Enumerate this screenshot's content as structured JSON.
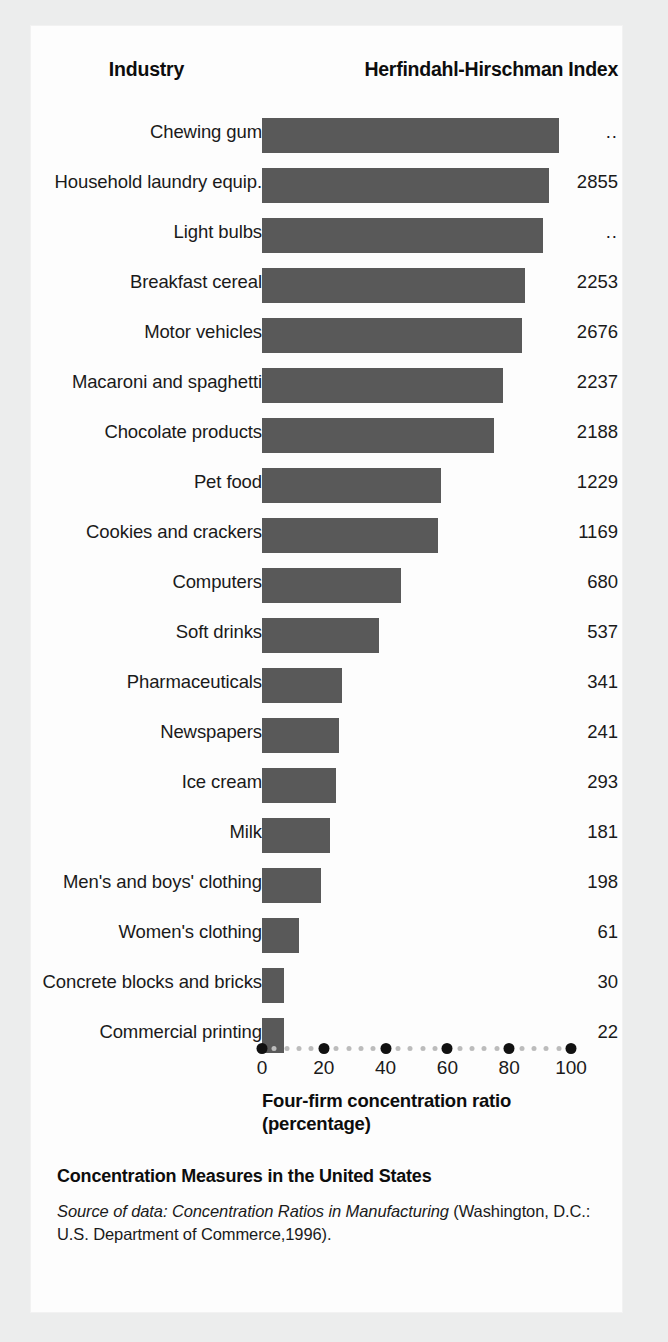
{
  "header": {
    "industry_label": "Industry",
    "hhi_label": "Herfindahl-Hirschman Index"
  },
  "axis": {
    "title_line1": "Four-firm concentration ratio",
    "title_line2": "(percentage)",
    "ticks": [
      "0",
      "20",
      "40",
      "60",
      "80",
      "100"
    ]
  },
  "footer": {
    "caption_title": "Concentration Measures in the United States",
    "source_prefix": "Source of data:",
    "source_italic_title": " Concentration Ratios in Manufacturing",
    "source_rest": " (Washington, D.C.: U.S. Department of Commerce,1996)."
  },
  "colors": {
    "bar": "#595959",
    "axis_major_dot": "#111111",
    "axis_minor_dot": "#bcbcbc",
    "card_background": "#fdfdfd",
    "page_background": "#eceded",
    "text": "#1a1a1a"
  },
  "chart_data": {
    "type": "bar",
    "orientation": "horizontal",
    "title": "Concentration Measures in the United States",
    "xlabel": "Four-firm concentration ratio (percentage)",
    "ylabel": "Industry",
    "xlim": [
      0,
      100
    ],
    "grid": false,
    "legend": "none",
    "categories": [
      "Chewing gum",
      "Household laundry equip.",
      "Light bulbs",
      "Breakfast cereal",
      "Motor vehicles",
      "Macaroni and spaghetti",
      "Chocolate products",
      "Pet food",
      "Cookies and crackers",
      "Computers",
      "Soft drinks",
      "Pharmaceuticals",
      "Newspapers",
      "Ice cream",
      "Milk",
      "Men's and boys' clothing",
      "Women's clothing",
      "Concrete blocks and bricks",
      "Commercial printing"
    ],
    "values": [
      96,
      93,
      91,
      85,
      84,
      78,
      75,
      58,
      57,
      45,
      38,
      26,
      25,
      24,
      22,
      19,
      12,
      7,
      7
    ],
    "hhi": [
      "..",
      "2855",
      "..",
      "2253",
      "2676",
      "2237",
      "2188",
      "1229",
      "1169",
      "680",
      "537",
      "341",
      "241",
      "293",
      "181",
      "198",
      "61",
      "30",
      "22"
    ],
    "series": [
      {
        "name": "Four-firm concentration ratio",
        "values": [
          96,
          93,
          91,
          85,
          84,
          78,
          75,
          58,
          57,
          45,
          38,
          26,
          25,
          24,
          22,
          19,
          12,
          7,
          7
        ]
      }
    ],
    "rows": [
      {
        "industry": "Chewing gum",
        "ratio": 96,
        "hhi": ".."
      },
      {
        "industry": "Household laundry equip.",
        "ratio": 93,
        "hhi": "2855"
      },
      {
        "industry": "Light bulbs",
        "ratio": 91,
        "hhi": ".."
      },
      {
        "industry": "Breakfast cereal",
        "ratio": 85,
        "hhi": "2253"
      },
      {
        "industry": "Motor vehicles",
        "ratio": 84,
        "hhi": "2676"
      },
      {
        "industry": "Macaroni and spaghetti",
        "ratio": 78,
        "hhi": "2237"
      },
      {
        "industry": "Chocolate products",
        "ratio": 75,
        "hhi": "2188"
      },
      {
        "industry": "Pet food",
        "ratio": 58,
        "hhi": "1229"
      },
      {
        "industry": "Cookies and crackers",
        "ratio": 57,
        "hhi": "1169"
      },
      {
        "industry": "Computers",
        "ratio": 45,
        "hhi": "680"
      },
      {
        "industry": "Soft drinks",
        "ratio": 38,
        "hhi": "537"
      },
      {
        "industry": "Pharmaceuticals",
        "ratio": 26,
        "hhi": "341"
      },
      {
        "industry": "Newspapers",
        "ratio": 25,
        "hhi": "241"
      },
      {
        "industry": "Ice cream",
        "ratio": 24,
        "hhi": "293"
      },
      {
        "industry": "Milk",
        "ratio": 22,
        "hhi": "181"
      },
      {
        "industry": "Men's and boys' clothing",
        "ratio": 19,
        "hhi": "198"
      },
      {
        "industry": "Women's clothing",
        "ratio": 12,
        "hhi": "61"
      },
      {
        "industry": "Concrete blocks and bricks",
        "ratio": 7,
        "hhi": "30"
      },
      {
        "industry": "Commercial printing",
        "ratio": 7,
        "hhi": "22"
      }
    ]
  }
}
